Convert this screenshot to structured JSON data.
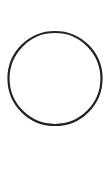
{
  "canvas": {
    "width": 103,
    "height": 171,
    "background": "#ffffff"
  },
  "shape": {
    "type": "circle",
    "icon": "circle-outline-icon",
    "cx": 55,
    "cy": 78.5,
    "r": 46.5,
    "stroke": "#222222",
    "stroke_width": 2.2,
    "fill": "none"
  }
}
